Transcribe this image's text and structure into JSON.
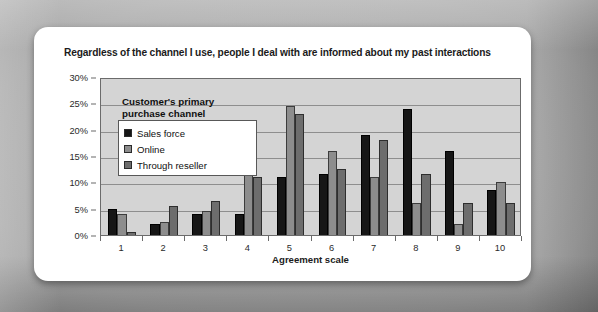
{
  "chart_data": {
    "type": "bar",
    "title": "Regardless of the channel I use, people I deal with are informed about my past interactions",
    "subtitle": "",
    "xlabel": "Agreement scale",
    "ylabel": "",
    "categories": [
      "1",
      "2",
      "3",
      "4",
      "5",
      "6",
      "7",
      "8",
      "9",
      "10"
    ],
    "ytick_labels": [
      "30%",
      "25%",
      "20%",
      "15%",
      "10%",
      "5%",
      "0%"
    ],
    "ytick_values": [
      30,
      25,
      20,
      15,
      10,
      5,
      0
    ],
    "ylim": [
      0,
      30
    ],
    "grid": true,
    "legend_position": "inside-top-left",
    "legend_title": "Customer's primary purchase channel",
    "series": [
      {
        "name": "Sales force",
        "color": "#161616",
        "values": [
          5.0,
          2.0,
          4.0,
          4.0,
          11.0,
          11.5,
          19.0,
          24.0,
          16.0,
          8.5
        ]
      },
      {
        "name": "Online",
        "color": "#8d8d8d",
        "values": [
          4.0,
          2.5,
          4.5,
          19.0,
          24.5,
          16.0,
          11.0,
          6.0,
          2.0,
          10.0
        ]
      },
      {
        "name": "Through reseller",
        "color": "#6d6d6d",
        "values": [
          0.5,
          5.5,
          6.5,
          11.0,
          23.0,
          12.5,
          18.0,
          11.5,
          6.0,
          6.0
        ]
      }
    ]
  },
  "legend": {
    "title_line1": "Customer's primary",
    "title_line2": "purchase channel"
  },
  "colors": {
    "plot_background": "#d4d4d4",
    "card_background": "#ffffff",
    "frame": "#9a9a9a",
    "gridline": "#8e8e8e",
    "axis": "#6b6b6b"
  }
}
